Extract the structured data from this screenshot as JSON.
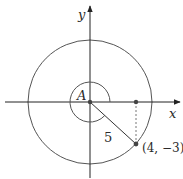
{
  "diagram": {
    "type": "unit-circle-angle",
    "axes": {
      "x_label": "x",
      "y_label": "y"
    },
    "angle_label": "A",
    "radius_label": "5",
    "point_label": "(4, −3)",
    "point": {
      "x": 4,
      "y": -3
    },
    "radius": 5,
    "colors": {
      "stroke": "#333333",
      "dashed": "#777777",
      "point": "#444444"
    }
  }
}
